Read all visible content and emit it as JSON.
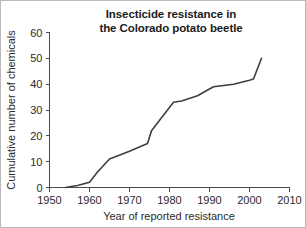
{
  "figure": {
    "background_color": "#ffffff",
    "border_color": "#b9b9b9",
    "line_color": "#3d3d45",
    "axis_color": "#4a4a4a",
    "text_color": "#2b2b2b"
  },
  "title": {
    "line1": "Insecticide resistance in",
    "line2": "the Colorado potato beetle"
  },
  "axes": {
    "x_label": "Year of reported resistance",
    "y_label": "Cumulative number of chemicals",
    "x_ticks": [
      "1950",
      "1960",
      "1970",
      "1980",
      "1990",
      "2000",
      "2010"
    ],
    "y_ticks": [
      "0",
      "10",
      "20",
      "30",
      "40",
      "50",
      "60"
    ]
  },
  "chart_data": {
    "type": "line",
    "title": "Insecticide resistance in the Colorado potato beetle",
    "xlabel": "Year of reported resistance",
    "ylabel": "Cumulative number of chemicals",
    "xlim": [
      1950,
      2010
    ],
    "ylim": [
      0,
      60
    ],
    "xticks": [
      1950,
      1960,
      1970,
      1980,
      1990,
      2000,
      2010
    ],
    "yticks": [
      0,
      10,
      20,
      30,
      40,
      50,
      60
    ],
    "grid": false,
    "legend": null,
    "series": [
      {
        "name": "Cumulative number of chemicals",
        "color": "#3d3d45",
        "x": [
          1954,
          1957,
          1960,
          1962,
          1965,
          1970,
          1974.5,
          1975.5,
          1978,
          1981,
          1983,
          1987,
          1991,
          1996,
          2000,
          2001,
          2003
        ],
        "y": [
          0,
          0.8,
          2,
          6,
          11,
          14,
          17,
          22,
          27,
          33,
          33.5,
          35.5,
          39,
          40,
          41.5,
          42,
          50
        ]
      }
    ]
  }
}
